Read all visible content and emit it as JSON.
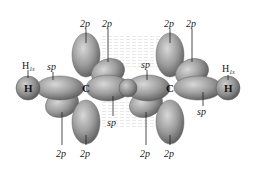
{
  "diagram": {
    "atoms": [
      {
        "id": "h_left",
        "symbol": "H",
        "x": 28,
        "y": 88
      },
      {
        "id": "c_left",
        "symbol": "C",
        "x": 86,
        "y": 88
      },
      {
        "id": "c_right",
        "symbol": "C",
        "x": 170,
        "y": 88
      },
      {
        "id": "h_right",
        "symbol": "H",
        "x": 228,
        "y": 88
      }
    ],
    "labels": {
      "top_2p_1": "2p",
      "top_2p_2": "2p",
      "top_2p_3": "2p",
      "top_2p_4": "2p",
      "h1s_left_main": "H",
      "h1s_left_sub": "1s",
      "sp_left": "sp",
      "sp_center_top": "sp",
      "sp_center_bottom": "sp",
      "sp_right": "sp",
      "h1s_right_main": "H",
      "h1s_right_sub": "1s",
      "bottom_2p_1": "2p",
      "bottom_2p_2": "2p",
      "bottom_2p_3": "2p",
      "bottom_2p_4": "2p"
    },
    "colors": {
      "lobe_fill": "#9a9a9a",
      "lobe_highlight": "#d6d6d6",
      "lobe_shadow": "#5e5e5e",
      "text": "#1a1a1a"
    }
  }
}
